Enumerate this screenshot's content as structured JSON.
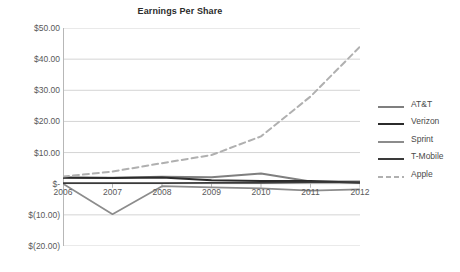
{
  "chart_data": {
    "type": "line",
    "title": "Earnings Per Share",
    "xlabel": "",
    "ylabel": "",
    "categories": [
      "2006",
      "2007",
      "2008",
      "2009",
      "2010",
      "2011",
      "2012"
    ],
    "x": [
      2006,
      2007,
      2008,
      2009,
      2010,
      2011,
      2012
    ],
    "ylim": [
      -20,
      50
    ],
    "yticks": [
      -20,
      -10,
      0,
      10,
      20,
      30,
      40,
      50
    ],
    "ytick_labels": [
      "$(20.00)",
      "$(10.00)",
      "$-",
      "$10.00",
      "$20.00",
      "$30.00",
      "$40.00",
      "$50.00"
    ],
    "grid": true,
    "legend_position": "right",
    "series": [
      {
        "name": "AT&T",
        "values": [
          2.0,
          1.9,
          2.2,
          2.1,
          3.3,
          0.7,
          0.7
        ],
        "color": "#7f7f7f",
        "style": "solid",
        "width": 2.0
      },
      {
        "name": "Verizon",
        "values": [
          1.9,
          1.8,
          2.0,
          1.1,
          0.9,
          0.9,
          0.3
        ],
        "color": "#2b2b2b",
        "style": "solid",
        "width": 2.0
      },
      {
        "name": "Sprint",
        "values": [
          0.0,
          -9.8,
          -0.8,
          -1.2,
          -1.5,
          -2.2,
          -1.8
        ],
        "color": "#8c8c8c",
        "style": "solid",
        "width": 1.7
      },
      {
        "name": "T-Mobile",
        "values": [
          0.2,
          0.2,
          0.2,
          0.3,
          0.3,
          0.4,
          0.4
        ],
        "color": "#3a3a3a",
        "style": "solid",
        "width": 1.7
      },
      {
        "name": "Apple",
        "values": [
          2.3,
          3.9,
          6.6,
          9.2,
          15.2,
          28.0,
          44.0
        ],
        "color": "#b0b0b0",
        "style": "dashed",
        "width": 2.0
      }
    ]
  },
  "legend": {
    "items": [
      {
        "label": "AT&T"
      },
      {
        "label": "Verizon"
      },
      {
        "label": "Sprint"
      },
      {
        "label": "T-Mobile"
      },
      {
        "label": "Apple"
      }
    ]
  },
  "colors": {
    "grid": "#d4d4d4",
    "axis": "#b7b7b7",
    "text": "#59595a",
    "title": "#2b2b2b",
    "background": "#ffffff"
  }
}
